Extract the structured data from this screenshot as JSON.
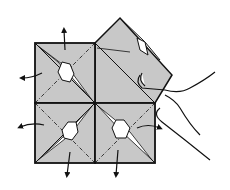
{
  "figure": {
    "kind": "origami folding diagram",
    "colors": {
      "paper": "#c8c8c8",
      "line": "#111111",
      "background": "#ffffff",
      "arrow_fill": "#ffffff"
    },
    "quadrants": [
      {
        "id": "top-left",
        "state": "squash-fold",
        "arrows": [
          "up",
          "left"
        ]
      },
      {
        "id": "bottom-left",
        "state": "squash-fold",
        "arrows": [
          "left",
          "down"
        ]
      },
      {
        "id": "bottom-right",
        "state": "squash-fold",
        "arrows": [
          "right",
          "down"
        ]
      },
      {
        "id": "top-right",
        "state": "raised flap held by hand"
      }
    ]
  }
}
